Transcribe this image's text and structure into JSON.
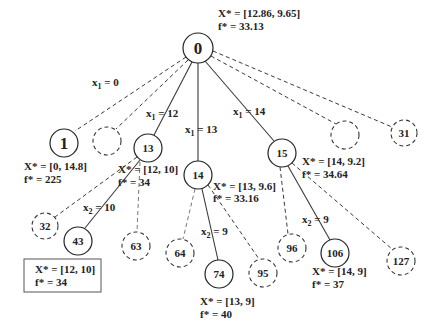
{
  "diagram": {
    "type": "branch-and-bound-tree",
    "root": {
      "id": "0",
      "x_star": "X* = [12.86, 9.65]",
      "f_star": "f* = 33.13"
    },
    "edge_labels": {
      "x1_0": {
        "var": "x",
        "sub": "1",
        "rest": " = 0"
      },
      "x1_12": {
        "var": "x",
        "sub": "1",
        "rest": " = 12"
      },
      "x1_13": {
        "var": "x",
        "sub": "1",
        "rest": " = 13"
      },
      "x1_14": {
        "var": "x",
        "sub": "1",
        "rest": " = 14"
      },
      "x2_10": {
        "var": "x",
        "sub": "2",
        "rest": " = 10"
      },
      "x2_9_a": {
        "var": "x",
        "sub": "2",
        "rest": " = 9"
      },
      "x2_9_b": {
        "var": "x",
        "sub": "2",
        "rest": " = 9"
      }
    },
    "nodes": [
      {
        "id": "1",
        "style": "solid",
        "x_star": "X* = [0, 14.8]",
        "f_star": "f* = 225"
      },
      {
        "id": "",
        "style": "dashed"
      },
      {
        "id": "13",
        "style": "solid",
        "x_star": "X* = [12, 10]",
        "f_star": "f* = 34"
      },
      {
        "id": "14",
        "style": "solid",
        "x_star": "X* = [13, 9.6]",
        "f_star": "f* = 33.16"
      },
      {
        "id": "15",
        "style": "solid",
        "x_star": "X* = [14, 9.2]",
        "f_star": "f* = 34.64"
      },
      {
        "id": "",
        "style": "dashed"
      },
      {
        "id": "31",
        "style": "dashed"
      },
      {
        "id": "32",
        "style": "dashed"
      },
      {
        "id": "43",
        "style": "solid"
      },
      {
        "id": "63",
        "style": "dashed"
      },
      {
        "id": "64",
        "style": "dashed"
      },
      {
        "id": "74",
        "style": "solid",
        "x_star": "X* = [13, 9]",
        "f_star": "f* = 40"
      },
      {
        "id": "95",
        "style": "dashed"
      },
      {
        "id": "96",
        "style": "dashed"
      },
      {
        "id": "106",
        "style": "solid",
        "x_star": "X* = [14, 9]",
        "f_star": "f* = 37"
      },
      {
        "id": "127",
        "style": "dashed"
      }
    ],
    "optimal_box": {
      "x_star": "X* = [12, 10]",
      "f_star": "f* = 34"
    }
  }
}
